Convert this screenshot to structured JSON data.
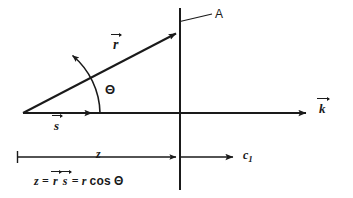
{
  "figure": {
    "background_color": "#ffffff",
    "ink_color": "#1a1a1a"
  },
  "labels": {
    "plane_label": "A",
    "wave_vector": "k",
    "position_vector": "r",
    "unit_vector": "s",
    "angle": "Θ",
    "distance": "z",
    "speed": "c",
    "speed_subscript": "1"
  },
  "equation": {
    "lhs": "z",
    "eq1": "=",
    "vec_r": "r",
    "vec_s": "s",
    "eq2": "=",
    "rhs_magnitude": "r",
    "rhs_cos": "cos",
    "rhs_angle": "Θ",
    "full_text": "z = r⃗ s⃗ = r cos Θ"
  },
  "geometry": {
    "origin": [
      23,
      113
    ],
    "axis_y": 113,
    "axis_end_x": 310,
    "plane_x": 180,
    "plane_top_y": 8,
    "plane_bottom_y": 190,
    "r_tip": [
      180,
      32
    ],
    "s_tip": [
      96,
      113
    ],
    "arc_radius": 60,
    "dimension_line_y": 157,
    "dimension_tick_x": 17,
    "c1_arrow_start_x": 180,
    "c1_arrow_end_x": 237,
    "leader_from": [
      180,
      22
    ],
    "leader_to": [
      212,
      14
    ]
  }
}
